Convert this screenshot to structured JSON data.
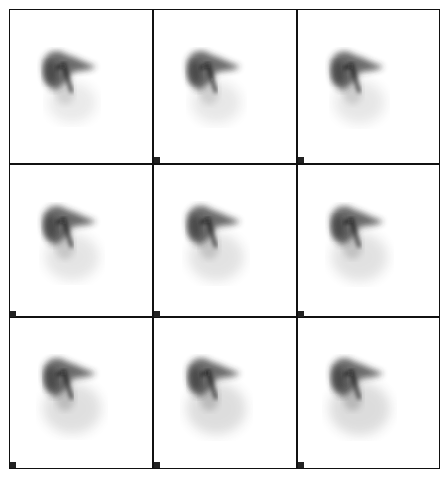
{
  "figure": {
    "type": "scintigraphy-frame-grid",
    "rows": 3,
    "cols": 3,
    "colors": {
      "border": "#111111",
      "background": "#ffffff",
      "activity": "#2a2a2a"
    }
  },
  "frames": [
    {
      "row": 0,
      "col": 0,
      "label": "",
      "gut": 0.15
    },
    {
      "row": 0,
      "col": 1,
      "label": "",
      "gut": 0.2
    },
    {
      "row": 0,
      "col": 2,
      "label": "",
      "gut": 0.25
    },
    {
      "row": 1,
      "col": 0,
      "label": "",
      "gut": 0.35
    },
    {
      "row": 1,
      "col": 1,
      "label": "",
      "gut": 0.4
    },
    {
      "row": 1,
      "col": 2,
      "label": "",
      "gut": 0.45
    },
    {
      "row": 2,
      "col": 0,
      "label": "",
      "gut": 0.55
    },
    {
      "row": 2,
      "col": 1,
      "label": "",
      "gut": 0.6
    },
    {
      "row": 2,
      "col": 2,
      "label": "",
      "gut": 0.65
    }
  ]
}
